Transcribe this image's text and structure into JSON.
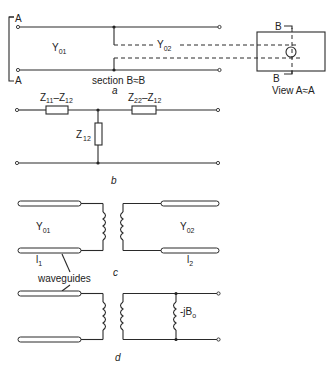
{
  "figure": {
    "part_a": {
      "caption": "a",
      "labels": {
        "A_top": "A",
        "A_bottom": "A",
        "Y01_main": "Y",
        "Y01_sub": "01",
        "Y02_main": "Y",
        "Y02_sub": "02",
        "section": "section  B≈B",
        "B_top": "B",
        "B_bottom": "B",
        "view_label": "View  A≈A"
      }
    },
    "part_b": {
      "caption": "b",
      "labels": {
        "z_left_1": "Z",
        "z_left_1_sub": "11",
        "z_left_dash": "–Z",
        "z_left_2_sub": "12",
        "z_right_1": "Z",
        "z_right_1_sub": "22",
        "z_right_dash": "–Z",
        "z_right_2_sub": "12",
        "z_shunt": "Z",
        "z_shunt_sub": "12"
      }
    },
    "part_c": {
      "caption": "c",
      "labels": {
        "Y01_main": "Y",
        "Y01_sub": "01",
        "Y02_main": "Y",
        "Y02_sub": "02",
        "l1_main": "l",
        "l1_sub": "1",
        "l2_main": "l",
        "l2_sub": "2",
        "waveguides": "waveguides"
      }
    },
    "part_d": {
      "caption": "d",
      "labels": {
        "jB_main": "-jB",
        "jB_sub": "o"
      }
    }
  }
}
